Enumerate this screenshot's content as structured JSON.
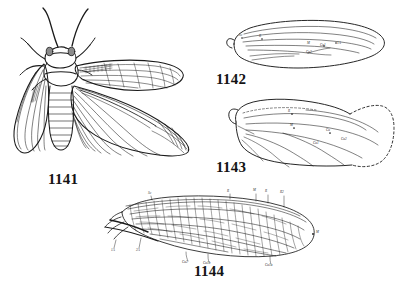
{
  "plate": {
    "background_color": "#ffffff",
    "ink_color": "#1a1a1a",
    "style": "black-and-white engraved line drawing",
    "figure_count": 4
  },
  "figures": [
    {
      "number": "1141",
      "label": "1141",
      "subject": "whole insect, dorsal view with wings spread",
      "features": "head with compound eyes, two long antennae, legs, segmented abdomen, narrow forewing and broad fan-folded hindwing"
    },
    {
      "number": "1142",
      "label": "1142",
      "subject": "narrow elongate wing venation diagram",
      "features": "slender lanceolate wing with longitudinal veins and few crossveins"
    },
    {
      "number": "1143",
      "label": "1143",
      "subject": "broad wing venation diagram with dashed outer margin",
      "features": "broader wing, branching longitudinal veins, dashed apical margin"
    },
    {
      "number": "1144",
      "label": "1144",
      "subject": "densely reticulate wing venation diagram",
      "features": "elongate wing with dense net-like crossvein reticulation across entire membrane"
    }
  ],
  "vein_labels": {
    "fig1142": [
      "Sc",
      "R",
      "M",
      "Cu1",
      "Cu2",
      "1A"
    ],
    "fig1143": [
      "R",
      "M",
      "Cu",
      "Cu1",
      "Cu2"
    ],
    "fig1144_upper": [
      "Sc",
      "R",
      "M",
      "R",
      "R2",
      "R5"
    ],
    "fig1144_lower": [
      "1A",
      "2A",
      "Cu2",
      "Cu1b",
      "Cu1a"
    ],
    "fig1144_apex": [
      "M"
    ]
  }
}
